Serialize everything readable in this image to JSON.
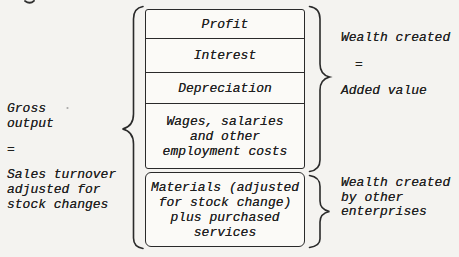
{
  "colors": {
    "ink": "#2a2a2a",
    "paper": "#f4f3f0",
    "box_fill": "#fbfaf7"
  },
  "stack": {
    "rows": [
      {
        "name": "profit",
        "lines": [
          "Profit"
        ]
      },
      {
        "name": "interest",
        "lines": [
          "Interest"
        ]
      },
      {
        "name": "depreciation",
        "lines": [
          "Depreciation"
        ]
      },
      {
        "name": "wages",
        "lines": [
          "Wages, salaries",
          "and other",
          "employment costs"
        ]
      },
      {
        "name": "materials",
        "lines": [
          "Materials (adjusted",
          "for stock change)",
          "plus purchased",
          "services"
        ]
      }
    ]
  },
  "left_annotation": {
    "lines": [
      "Gross",
      "output",
      "=",
      "Sales turnover",
      "adjusted for",
      "stock changes"
    ]
  },
  "right_top_annotation": {
    "lines": [
      "Wealth created",
      "=",
      "Added value"
    ]
  },
  "right_bottom_annotation": {
    "lines": [
      "Wealth created",
      "by other",
      "enterprises"
    ]
  }
}
